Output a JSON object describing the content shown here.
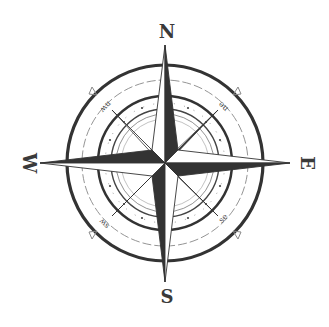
{
  "figure": {
    "colors": {
      "ink": "#333333",
      "light_ink": "#777777",
      "background": "#ffffff"
    }
  },
  "labels": {
    "cardinal": {
      "north": "N",
      "south": "S",
      "east": "E",
      "west": "W"
    },
    "intercardinal": {
      "northeast": "ne",
      "northwest": "nw",
      "southeast": "se",
      "southwest": "sw"
    }
  }
}
